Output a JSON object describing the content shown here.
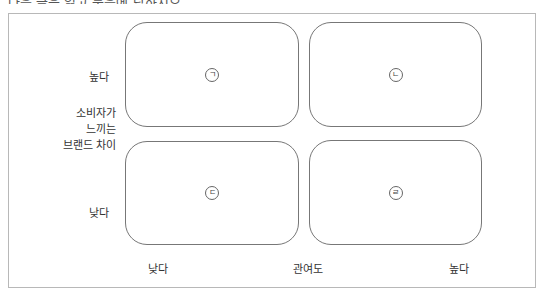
{
  "caption": "다음 글을 읽고 물음에 답하시오.",
  "diagram": {
    "y_axis": {
      "title_lines": [
        "소비자가",
        "느끼는",
        "브랜드 차이"
      ],
      "high": "높다",
      "low": "낮다"
    },
    "x_axis": {
      "title": "관여도",
      "low": "낮다",
      "high": "높다"
    },
    "cells": [
      {
        "position": "top-left",
        "marker": "ㄱ"
      },
      {
        "position": "top-right",
        "marker": "ㄴ"
      },
      {
        "position": "bottom-left",
        "marker": "ㄷ"
      },
      {
        "position": "bottom-right",
        "marker": "ㄹ"
      }
    ]
  }
}
